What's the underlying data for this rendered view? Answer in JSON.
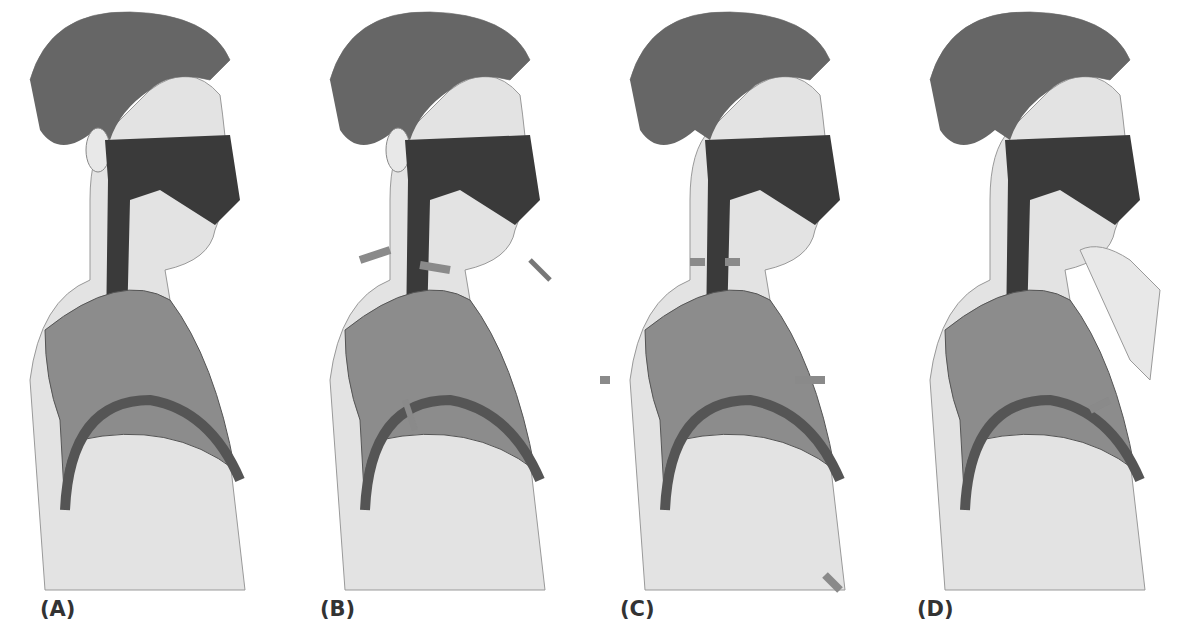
{
  "figure": {
    "panels": [
      {
        "id": "A",
        "label": "(A)"
      },
      {
        "id": "B",
        "label": "(B)"
      },
      {
        "id": "C",
        "label": "(C)"
      },
      {
        "id": "D",
        "label": "(D)"
      }
    ]
  },
  "colors": {
    "hair": "#555555",
    "skin": "#e3e3e3",
    "airway": "#3a3a3a",
    "lung": "#8c8c8c",
    "diaphragm": "#555555",
    "arrow": "#8a8a8a",
    "dark_arrow": "#555555",
    "label": "#333333"
  }
}
